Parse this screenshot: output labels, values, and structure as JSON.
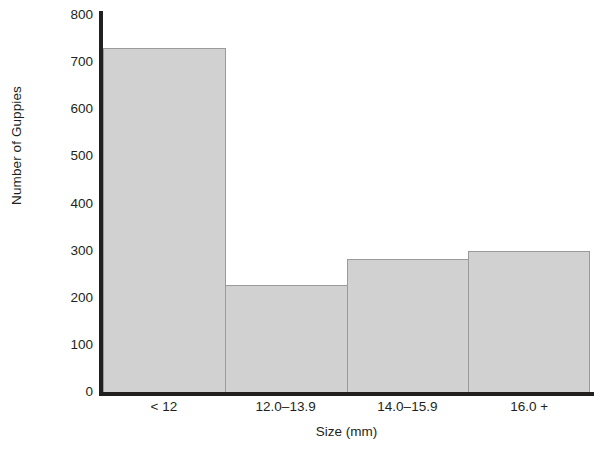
{
  "chart_data": {
    "type": "bar",
    "title": "",
    "xlabel": "Size (mm)",
    "ylabel": "Number of Guppies",
    "categories": [
      "< 12",
      "12.0–13.9",
      "14.0–15.9",
      "16.0 +"
    ],
    "values": [
      730,
      228,
      282,
      300
    ],
    "ylim": [
      0,
      800
    ],
    "yticks": [
      800,
      700,
      600,
      500,
      400,
      300,
      200,
      100,
      0
    ],
    "ytick_labels": [
      "800",
      "700",
      "600",
      "500",
      "400",
      "300",
      "200",
      "100",
      "0"
    ],
    "grid": false,
    "legend": false,
    "legend_position": "none",
    "bar_style": "contiguous-histogram",
    "colors": {
      "bar_fill": "#d1d1d1",
      "bar_border": "#9a9a9a",
      "axis": "#221f1f",
      "text": "#231f20",
      "background": "#ffffff"
    }
  }
}
